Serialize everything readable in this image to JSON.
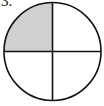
{
  "problem": {
    "label": "3."
  },
  "diagram": {
    "shape": "circle",
    "divisions": 4,
    "shaded_parts": 1,
    "shaded_quadrant": "upper-left",
    "colors": {
      "stroke": "#111111",
      "shade": "#d0d0d0",
      "background": "#ffffff"
    }
  }
}
